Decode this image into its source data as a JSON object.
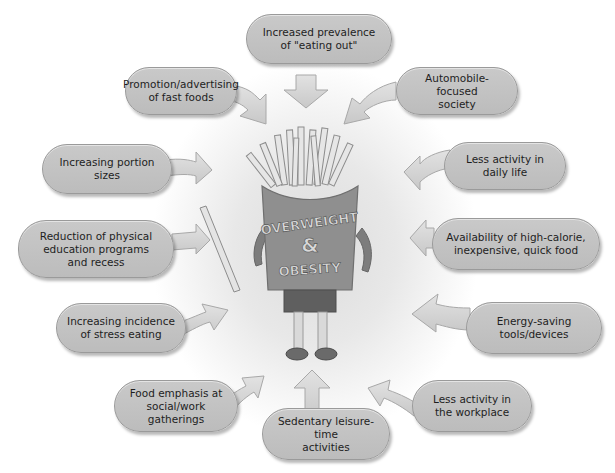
{
  "diagram": {
    "center": {
      "line1": "OVERWEIGHT",
      "line2": "&",
      "line3": "OBESITY",
      "figure": "french-fries-box-character"
    },
    "factors": [
      {
        "id": "eating-out",
        "label": "Increased prevalence\nof \"eating out\"",
        "arrow": "down"
      },
      {
        "id": "fast-food-ads",
        "label": "Promotion/advertising\nof fast foods",
        "arrow": "right-down"
      },
      {
        "id": "automobile",
        "label": "Automobile-focused\nsociety",
        "arrow": "left-down"
      },
      {
        "id": "portion-sizes",
        "label": "Increasing portion\nsizes",
        "arrow": "right"
      },
      {
        "id": "daily-activity",
        "label": "Less activity in\ndaily life",
        "arrow": "left"
      },
      {
        "id": "physical-education",
        "label": "Reduction of physical\neducation programs\nand recess",
        "arrow": "right"
      },
      {
        "id": "high-calorie-food",
        "label": "Availability of high-calorie,\ninexpensive, quick food",
        "arrow": "left"
      },
      {
        "id": "stress-eating",
        "label": "Increasing incidence\nof stress eating",
        "arrow": "right-up"
      },
      {
        "id": "energy-saving",
        "label": "Energy-saving\ntools/devices",
        "arrow": "left"
      },
      {
        "id": "social-gatherings",
        "label": "Food emphasis at\nsocial/work gatherings",
        "arrow": "right-up"
      },
      {
        "id": "sedentary-leisure",
        "label": "Sedentary leisure-time\nactivities",
        "arrow": "up"
      },
      {
        "id": "workplace-activity",
        "label": "Less activity in\nthe workplace",
        "arrow": "left-up"
      }
    ],
    "colors": {
      "bubble_fill": "#c2c2c2",
      "bubble_border": "#9a9a9a",
      "arrow_fill": "#d6d6d6",
      "box_fill": "#8f8f8f",
      "text": "#1e1e1e"
    }
  }
}
